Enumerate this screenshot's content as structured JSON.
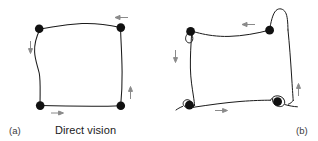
{
  "figure": {
    "background_color": "#ffffff",
    "ink_color": "#1a1a1a",
    "arrow_color": "#808080",
    "width": 318,
    "height": 141
  },
  "panels": [
    {
      "id": "a",
      "letter": "(a)",
      "caption": "Direct vision",
      "condition": "direct-vision",
      "description": "Smooth hand-drawn square traced counter-clockwise with four black marker dots at the corners and four grey direction arrows",
      "corner_dots": 4,
      "arrows": [
        {
          "name": "top-arrow",
          "direction": "left",
          "x": 118,
          "y": 18
        },
        {
          "name": "left-arrow",
          "direction": "down",
          "x": 36,
          "y": 47
        },
        {
          "name": "bottom-arrow",
          "direction": "right",
          "x": 57,
          "y": 107
        },
        {
          "name": "right-arrow",
          "direction": "up",
          "x": 127,
          "y": 95
        }
      ]
    },
    {
      "id": "b",
      "letter": "(b)",
      "caption": "Mirror vision",
      "condition": "mirror-vision",
      "description": "Wobbly hand-drawn square with overshoots and loops at each corner, four black marker dots at the corners and four grey direction arrows",
      "corner_dots": 4,
      "arrows": [
        {
          "name": "top-arrow",
          "direction": "left",
          "x": 120,
          "y": 23
        },
        {
          "name": "left-arrow",
          "direction": "down",
          "x": 20,
          "y": 55
        },
        {
          "name": "bottom-arrow",
          "direction": "right",
          "x": 60,
          "y": 110
        },
        {
          "name": "right-arrow",
          "direction": "up",
          "x": 120,
          "y": 95
        }
      ]
    }
  ]
}
